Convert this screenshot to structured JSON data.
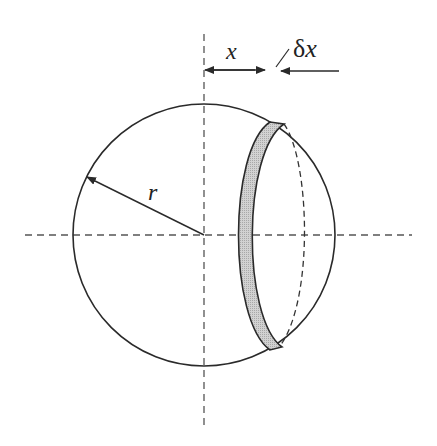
{
  "diagram": {
    "type": "sphere-slice",
    "labels": {
      "radius": "r",
      "distance": "x",
      "thickness_delta": "δ",
      "thickness_var": "x"
    },
    "colors": {
      "stroke": "#2a2a2a",
      "dash": "#555555",
      "slice_fill": "#c8c8c8",
      "background": "#ffffff"
    }
  }
}
